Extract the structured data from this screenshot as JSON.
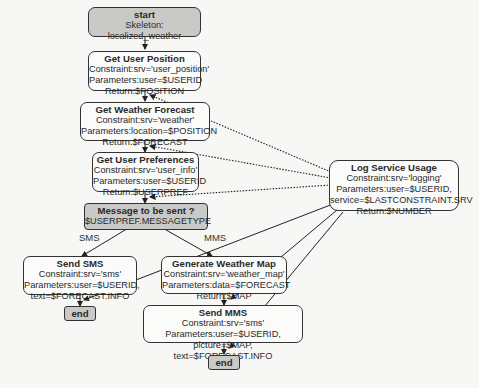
{
  "diagram": {
    "background_text_note": "faint scanned-page show-through text",
    "nodes": {
      "start": {
        "title": "start",
        "lines": [
          "Skeleton: localized_weather"
        ]
      },
      "get_user_position": {
        "title": "Get User Position",
        "lines": [
          "Constraint:srv='user_position'",
          "Parameters:user=$USERID",
          "Return:$POSITION"
        ]
      },
      "get_weather_forecast": {
        "title": "Get Weather Forecast",
        "lines": [
          "Constraint:srv='weather'",
          "Parameters:location=$POSITION",
          "Return:$FORECAST"
        ]
      },
      "get_user_preferences": {
        "title": "Get User Preferences",
        "lines": [
          "Constraint:srv='user_info'",
          "Parameters:user=$USERID",
          "Return:$USERPREF"
        ]
      },
      "decision": {
        "title": "Message to be sent ?",
        "lines": [
          "$USERPREF.MESSAGETYPE"
        ]
      },
      "send_sms": {
        "title": "Send SMS",
        "lines": [
          "Constraint:srv='sms'",
          "Parameters:user=$USERID,",
          "text=$FORECAST.INFO"
        ]
      },
      "generate_weather_map": {
        "title": "Generate Weather Map",
        "lines": [
          "Constraint:srv='weather_map'",
          "Parameters:data=$FORECAST",
          "Return:$MAP"
        ]
      },
      "send_mms": {
        "title": "Send MMS",
        "lines": [
          "Constraint:srv='sms'",
          "Parameters:user=$USERID,",
          "picture=$MAP, text=$FORECAST.INFO"
        ]
      },
      "end_sms": {
        "title": "end"
      },
      "end_mms": {
        "title": "end"
      },
      "log_service_usage": {
        "title": "Log Service Usage",
        "lines": [
          "Constraint:srv='logging'",
          "Parameters:user=$USERID,",
          "service=$LASTCONSTRAINT.SRV",
          "Return:$NUMBER"
        ]
      }
    },
    "branch_labels": {
      "sms": "SMS",
      "mms": "MMS"
    },
    "colors": {
      "grey_node": "#c9c9c7",
      "white_node": "#fbfbfa",
      "stroke": "#333333"
    }
  }
}
